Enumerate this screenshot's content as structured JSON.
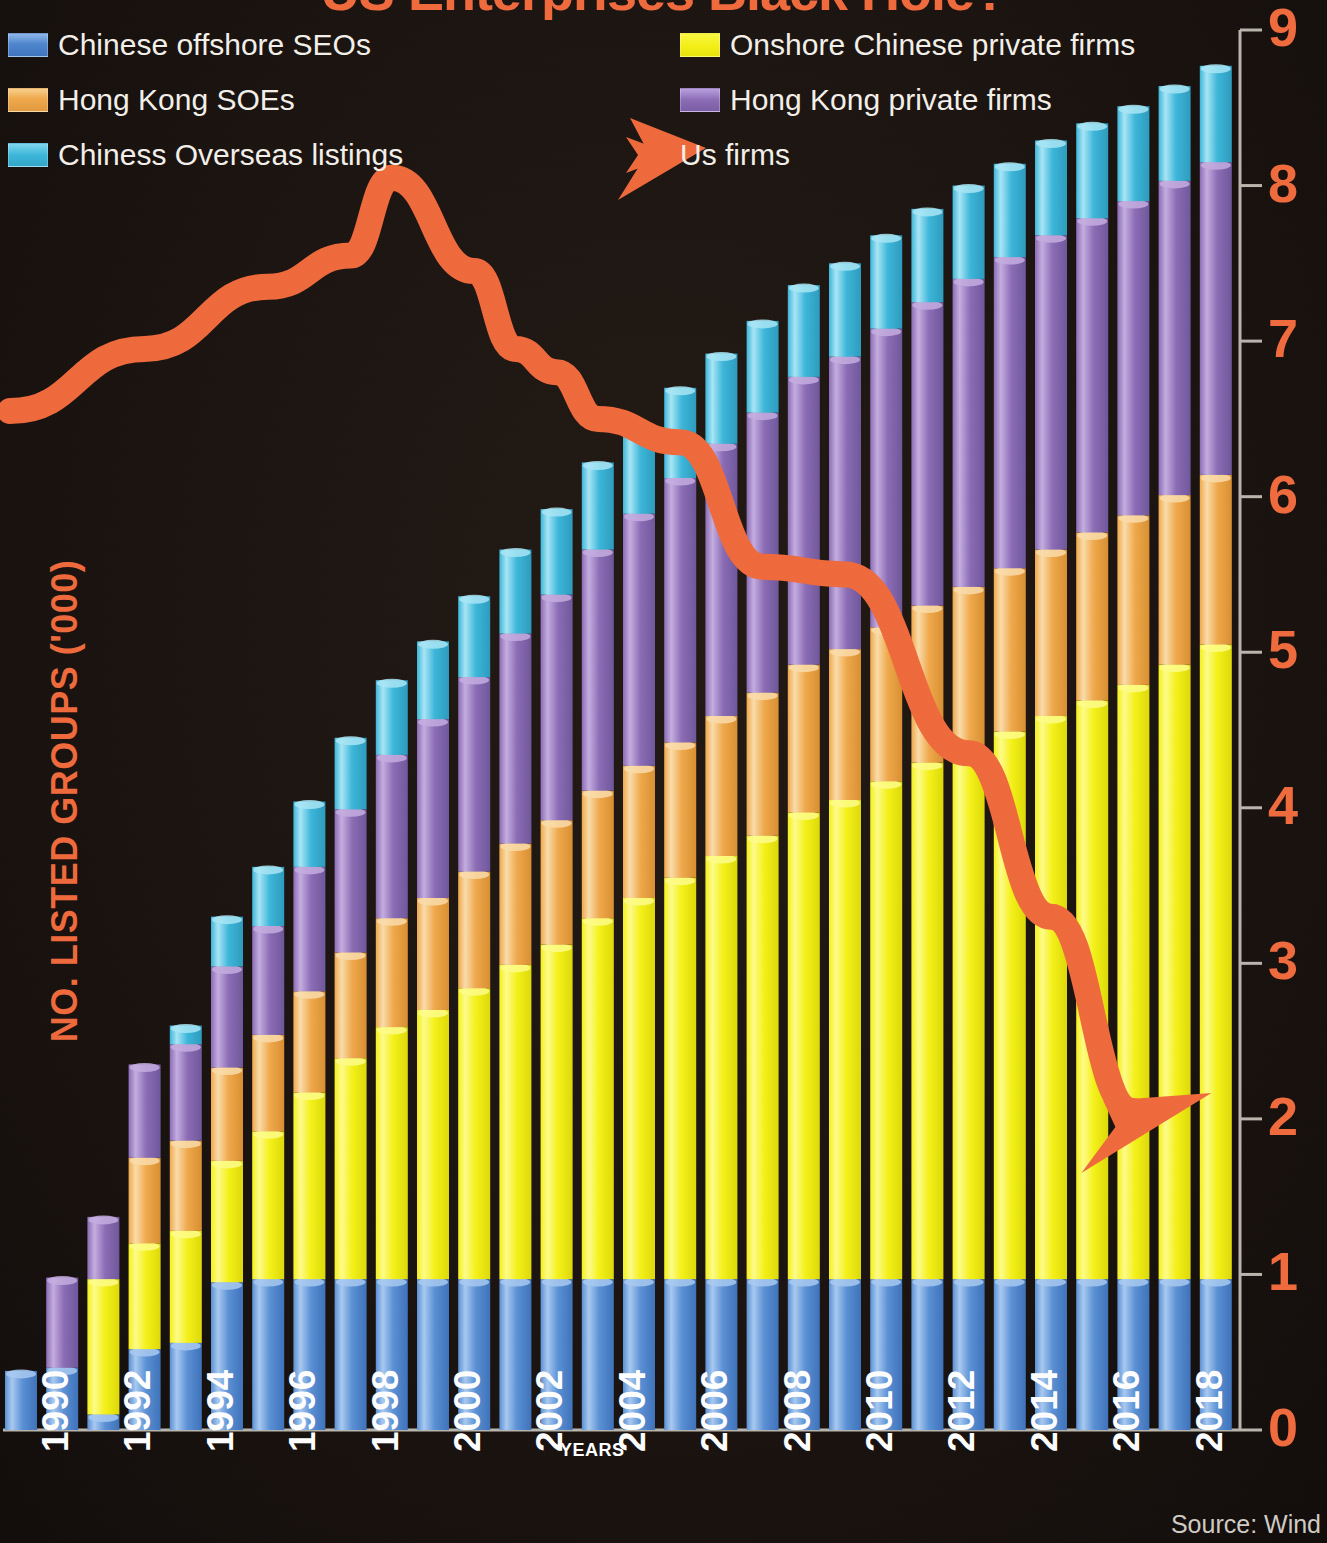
{
  "title": "US Enterprises Black Hole?",
  "source": "Source: Wind",
  "axes": {
    "ylabel": "NO. LISTED GROUPS ('000)",
    "xlabel": "YEARS",
    "yticks": [
      "9",
      "8",
      "7",
      "6",
      "5",
      "4",
      "3",
      "2",
      "1",
      "0"
    ],
    "xticks": [
      "1990",
      "1992",
      "1994",
      "1996",
      "1998",
      "2000",
      "2002",
      "2004",
      "2006",
      "2008",
      "2010",
      "2012",
      "2014",
      "2016",
      "2018"
    ]
  },
  "legend": {
    "items": [
      {
        "label": "Chinese offshore SEOs",
        "color": "#4e86cd",
        "swatch": "sw-blue",
        "col": 0,
        "row": 0
      },
      {
        "label": "Hong Kong SOEs",
        "color": "#efa84b",
        "swatch": "sw-orange",
        "col": 0,
        "row": 1
      },
      {
        "label": "Chiness Overseas listings",
        "color": "#3cb6d9",
        "swatch": "sw-cyan",
        "col": 0,
        "row": 2
      },
      {
        "label": "Onshore Chinese private firms",
        "color": "#f2ee14",
        "swatch": "sw-yellow",
        "col": 1,
        "row": 0
      },
      {
        "label": "Hong Kong private firms",
        "color": "#8b6cb5",
        "swatch": "sw-purple",
        "col": 1,
        "row": 1
      },
      {
        "label": "Us firms",
        "color": "#ee6a3c",
        "swatch": "sw-arrow",
        "col": 1,
        "row": 2
      }
    ]
  },
  "colors": {
    "background": "#1a1310",
    "accent": "#ee6a3c",
    "blue": "#4e86cd",
    "yellow": "#f2ee14",
    "orange": "#efa84b",
    "purple": "#8b6cb5",
    "cyan": "#3cb6d9",
    "axis": "#b9b5ac"
  },
  "chart_data": {
    "type": "bar",
    "title": "US Enterprises Black Hole?",
    "xlabel": "YEARS",
    "ylabel": "NO. LISTED GROUPS ('000)",
    "ylim": [
      0,
      9
    ],
    "grid": false,
    "legend_position": "top",
    "stacked": true,
    "categories": [
      "1990",
      "1991",
      "1992",
      "1993",
      "1994",
      "1995",
      "1996",
      "1997",
      "1998",
      "1999",
      "2000",
      "2001",
      "2002",
      "2003",
      "2004",
      "2005",
      "2006",
      "2007",
      "2008",
      "2009",
      "2010",
      "2011",
      "2012",
      "2013",
      "2014",
      "2015",
      "2016",
      "2017",
      "2018",
      "2019"
    ],
    "series": [
      {
        "name": "Chinese offshore SEOs",
        "color": "#4e86cd",
        "values": [
          0.38,
          0.4,
          0.1,
          0.52,
          0.56,
          0.95,
          0.97,
          0.97,
          0.97,
          0.97,
          0.97,
          0.97,
          0.97,
          0.97,
          0.97,
          0.97,
          0.97,
          0.97,
          0.97,
          0.97,
          0.97,
          0.97,
          0.97,
          0.97,
          0.97,
          0.97,
          0.97,
          0.97,
          0.97,
          0.97
        ]
      },
      {
        "name": "Onshore Chinese private firms",
        "color": "#f2ee14",
        "values": [
          0.0,
          0.0,
          0.87,
          0.68,
          0.72,
          0.78,
          0.95,
          1.2,
          1.42,
          1.62,
          1.73,
          1.87,
          2.02,
          2.15,
          2.32,
          2.45,
          2.58,
          2.72,
          2.85,
          3.0,
          3.08,
          3.2,
          3.32,
          3.42,
          3.52,
          3.62,
          3.72,
          3.82,
          3.95,
          4.08
        ]
      },
      {
        "name": "Hong Kong SOEs",
        "color": "#efa84b",
        "values": [
          0.0,
          0.0,
          0.0,
          0.55,
          0.58,
          0.6,
          0.62,
          0.65,
          0.68,
          0.7,
          0.72,
          0.75,
          0.78,
          0.8,
          0.82,
          0.85,
          0.87,
          0.9,
          0.92,
          0.95,
          0.97,
          0.99,
          1.01,
          1.03,
          1.05,
          1.07,
          1.08,
          1.09,
          1.09,
          1.09
        ]
      },
      {
        "name": "Hong Kong private firms",
        "color": "#8b6cb5",
        "values": [
          0.0,
          0.58,
          0.4,
          0.6,
          0.62,
          0.65,
          0.7,
          0.8,
          0.92,
          1.05,
          1.15,
          1.25,
          1.35,
          1.45,
          1.55,
          1.62,
          1.7,
          1.75,
          1.8,
          1.85,
          1.88,
          1.92,
          1.95,
          1.98,
          2.0,
          2.02,
          2.02,
          2.02,
          2.02,
          2.01
        ]
      },
      {
        "name": "Chiness Overseas listings",
        "color": "#3cb6d9",
        "values": [
          0.0,
          0.0,
          0.0,
          0.0,
          0.12,
          0.32,
          0.38,
          0.42,
          0.46,
          0.48,
          0.5,
          0.52,
          0.54,
          0.55,
          0.56,
          0.57,
          0.58,
          0.58,
          0.59,
          0.59,
          0.6,
          0.6,
          0.6,
          0.6,
          0.6,
          0.61,
          0.61,
          0.61,
          0.61,
          0.62
        ]
      }
    ],
    "totals": [
      0.38,
      0.98,
      1.37,
      2.35,
      2.6,
      3.3,
      3.62,
      4.04,
      4.45,
      4.82,
      5.07,
      5.36,
      5.66,
      5.92,
      6.22,
      6.46,
      6.7,
      6.92,
      7.13,
      7.36,
      7.5,
      7.68,
      7.85,
      8.0,
      8.14,
      8.29,
      8.4,
      8.51,
      8.64,
      8.77
    ],
    "overlay_line": {
      "name": "Us firms",
      "color": "#ee6a3c",
      "type": "line",
      "arrow_head": true,
      "points": [
        {
          "x": "1990",
          "y": 6.55
        },
        {
          "x": "1993",
          "y": 6.95
        },
        {
          "x": "1996",
          "y": 7.35
        },
        {
          "x": "1998",
          "y": 7.55
        },
        {
          "x": "1999",
          "y": 8.05
        },
        {
          "x": "2001",
          "y": 7.45
        },
        {
          "x": "2002",
          "y": 6.95
        },
        {
          "x": "2003",
          "y": 6.8
        },
        {
          "x": "2004",
          "y": 6.5
        },
        {
          "x": "2006",
          "y": 6.35
        },
        {
          "x": "2008",
          "y": 5.55
        },
        {
          "x": "2010",
          "y": 5.5
        },
        {
          "x": "2013",
          "y": 4.35
        },
        {
          "x": "2015",
          "y": 3.3
        },
        {
          "x": "2017",
          "y": 2.05
        }
      ]
    }
  },
  "geometry": {
    "plot_left": 5,
    "plot_right": 1240,
    "plot_bottom": 1430,
    "y_top_px": 30,
    "bar_pitch": 41.2,
    "bar_width": 32
  }
}
